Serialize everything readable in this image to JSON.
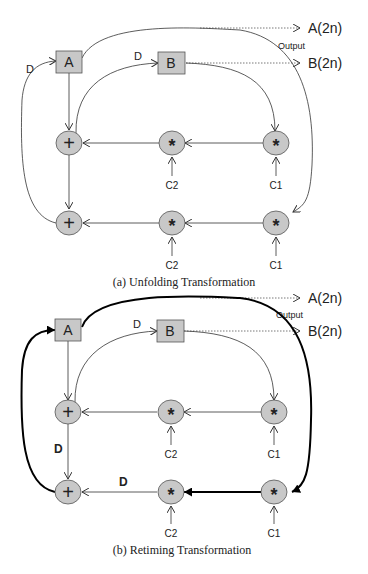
{
  "colors": {
    "node_fill": "#c8c8c8",
    "stroke": "#444444",
    "bold_stroke": "#000000"
  },
  "diagram_a": {
    "caption": "(a) Unfolding Transformation",
    "registers": [
      {
        "id": "A",
        "label": "A"
      },
      {
        "id": "B",
        "label": "B"
      }
    ],
    "delay_labels": [
      "D",
      "D"
    ],
    "output_label": "Output",
    "outputs": [
      "A(2n)",
      "B(2n)"
    ],
    "row1": {
      "adder": "+",
      "mult_mid": "*",
      "mult_right": "*"
    },
    "row2": {
      "adder": "+",
      "mult_mid": "*",
      "mult_right": "*"
    },
    "coeffs_row1": [
      "C2",
      "C1"
    ],
    "coeffs_row2": [
      "C2",
      "C1"
    ]
  },
  "diagram_b": {
    "caption": "(b) Retiming Transformation",
    "registers": [
      {
        "id": "A",
        "label": "A"
      },
      {
        "id": "B",
        "label": "B"
      }
    ],
    "delay_labels": [
      "D",
      "D",
      "D"
    ],
    "output_label": "Output",
    "outputs": [
      "A(2n)",
      "B(2n)"
    ],
    "row1": {
      "adder": "+",
      "mult_mid": "*",
      "mult_right": "*"
    },
    "row2": {
      "adder": "+",
      "mult_mid": "*",
      "mult_right": "*"
    },
    "coeffs_row1": [
      "C2",
      "C1"
    ],
    "coeffs_row2": [
      "C2",
      "C1"
    ]
  }
}
